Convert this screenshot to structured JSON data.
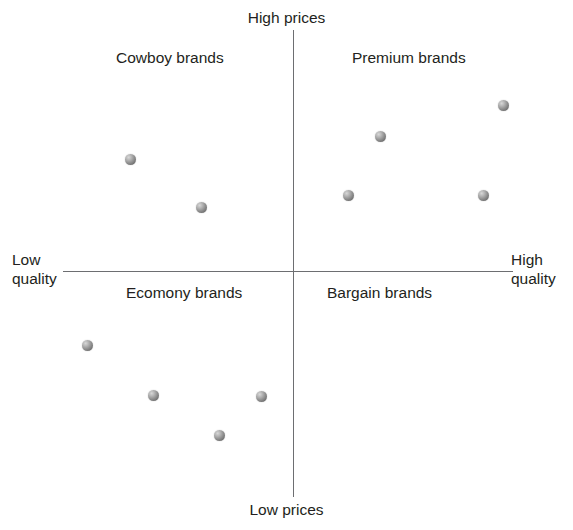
{
  "chart_data": {
    "type": "scatter",
    "title": "",
    "xlabel": "quality",
    "ylabel": "prices",
    "grid": false,
    "legend": null,
    "axis_labels": {
      "top": "High prices",
      "bottom": "Low prices",
      "left_line1": "Low",
      "left_line2": "quality",
      "right_line1": "High",
      "right_line2": "quality"
    },
    "quadrants": [
      {
        "id": "top-left",
        "label": "Cowboy brands"
      },
      {
        "id": "top-right",
        "label": "Premium brands"
      },
      {
        "id": "bottom-left",
        "label": "Ecomony brands"
      },
      {
        "id": "bottom-right",
        "label": "Bargain brands"
      }
    ],
    "axis_origin": {
      "x": 293,
      "y": 271
    },
    "xlim": [
      63,
      513
    ],
    "ylim": [
      30,
      497
    ],
    "points": [
      {
        "x": 130,
        "y": 159,
        "quadrant": "top-left"
      },
      {
        "x": 201,
        "y": 207,
        "quadrant": "top-left"
      },
      {
        "x": 503,
        "y": 105,
        "quadrant": "top-right"
      },
      {
        "x": 380,
        "y": 136,
        "quadrant": "top-right"
      },
      {
        "x": 348,
        "y": 195,
        "quadrant": "top-right"
      },
      {
        "x": 483,
        "y": 195,
        "quadrant": "top-right"
      },
      {
        "x": 87,
        "y": 345,
        "quadrant": "bottom-left"
      },
      {
        "x": 153,
        "y": 395,
        "quadrant": "bottom-left"
      },
      {
        "x": 261,
        "y": 396,
        "quadrant": "bottom-left"
      },
      {
        "x": 219,
        "y": 435,
        "quadrant": "bottom-left"
      }
    ],
    "colors": {
      "axis": "#6d6e71",
      "text": "#231f20",
      "marker_light": "#d8d8d8",
      "marker_dark": "#5d5d5d",
      "background": "#ffffff"
    }
  }
}
